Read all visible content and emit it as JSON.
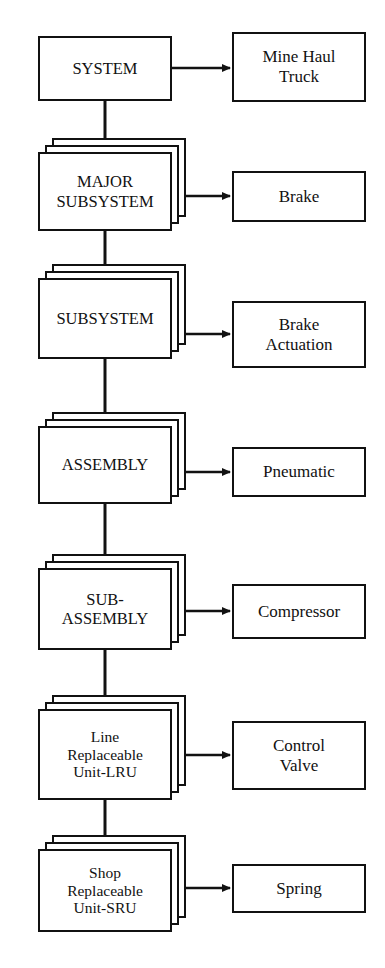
{
  "diagram": {
    "type": "hierarchy-flow",
    "orientation": "top-to-bottom",
    "colors": {
      "stroke": "#111111",
      "fill": "#ffffff",
      "background": "#ffffff"
    },
    "levels": [
      {
        "id": "system",
        "label": "SYSTEM",
        "example": "Mine Haul\nTruck",
        "stacked": false,
        "geometry": {
          "x": 38,
          "y": 36,
          "w": 134,
          "h": 65
        },
        "example_geometry": {
          "x": 232,
          "y": 32,
          "w": 134,
          "h": 70
        }
      },
      {
        "id": "major-subsystem",
        "label": "MAJOR\nSUBSYSTEM",
        "example": "Brake",
        "stacked": true,
        "geometry": {
          "x": 38,
          "y": 152,
          "w": 134,
          "h": 79
        },
        "example_geometry": {
          "x": 232,
          "y": 171,
          "w": 134,
          "h": 51
        }
      },
      {
        "id": "subsystem",
        "label": "SUBSYSTEM",
        "example": "Brake\nActuation",
        "stacked": true,
        "geometry": {
          "x": 38,
          "y": 278,
          "w": 134,
          "h": 81
        },
        "example_geometry": {
          "x": 232,
          "y": 301,
          "w": 134,
          "h": 67
        }
      },
      {
        "id": "assembly",
        "label": "ASSEMBLY",
        "example": "Pneumatic",
        "stacked": true,
        "geometry": {
          "x": 38,
          "y": 426,
          "w": 134,
          "h": 78
        },
        "example_geometry": {
          "x": 232,
          "y": 447,
          "w": 134,
          "h": 50
        }
      },
      {
        "id": "sub-assembly",
        "label": "SUB-\nASSEMBLY",
        "example": "Compressor",
        "stacked": true,
        "geometry": {
          "x": 38,
          "y": 568,
          "w": 134,
          "h": 82
        },
        "example_geometry": {
          "x": 232,
          "y": 584,
          "w": 134,
          "h": 55
        }
      },
      {
        "id": "lru",
        "label": "Line\nReplaceable\nUnit-LRU",
        "example": "Control\nValve",
        "stacked": true,
        "geometry": {
          "x": 38,
          "y": 709,
          "w": 134,
          "h": 91
        },
        "example_geometry": {
          "x": 232,
          "y": 721,
          "w": 134,
          "h": 69
        }
      },
      {
        "id": "sru",
        "label": "Shop\nReplaceable\nUnit-SRU",
        "example": "Spring",
        "stacked": true,
        "geometry": {
          "x": 38,
          "y": 849,
          "w": 134,
          "h": 83
        },
        "example_geometry": {
          "x": 232,
          "y": 864,
          "w": 134,
          "h": 49
        }
      }
    ],
    "stack": {
      "sheets": 2,
      "offset_x": 7,
      "offset_y": 7
    },
    "connectors": {
      "vertical_x": 105,
      "horizontal_arrow_end_x": 230,
      "down_arrows": [
        {
          "from": "system",
          "to": "major-subsystem",
          "y1": 101,
          "y2": 152
        },
        {
          "from": "major-subsystem",
          "to": "subsystem",
          "y1": 231,
          "y2": 278
        },
        {
          "from": "subsystem",
          "to": "assembly",
          "y1": 359,
          "y2": 426
        },
        {
          "from": "assembly",
          "to": "sub-assembly",
          "y1": 504,
          "y2": 568
        },
        {
          "from": "sub-assembly",
          "to": "lru",
          "y1": 650,
          "y2": 709
        },
        {
          "from": "lru",
          "to": "sru",
          "y1": 800,
          "y2": 849
        }
      ],
      "side_arrows": [
        {
          "node": "system",
          "x1": 172,
          "y": 68
        },
        {
          "node": "major-subsystem",
          "x1": 186,
          "y": 196
        },
        {
          "node": "subsystem",
          "x1": 186,
          "y": 334
        },
        {
          "node": "assembly",
          "x1": 186,
          "y": 472
        },
        {
          "node": "sub-assembly",
          "x1": 186,
          "y": 611
        },
        {
          "node": "lru",
          "x1": 186,
          "y": 755
        },
        {
          "node": "sru",
          "x1": 186,
          "y": 888
        }
      ]
    }
  }
}
